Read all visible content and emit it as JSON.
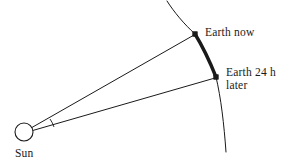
{
  "figure": {
    "background_color": "#ffffff",
    "stroke_color": "#1a1a1a",
    "labels": {
      "earth_now": "Earth now",
      "earth_later_line1": "Earth 24 h",
      "earth_later_line2": "later",
      "sun": "Sun"
    },
    "elements": {
      "sun_icon": "sun-circle",
      "orbit_arc": "orbit-arc",
      "traveled_arc": "traveled-arc-segment",
      "radius_line_now": "radius-line-earth-now",
      "radius_line_later": "radius-line-earth-later",
      "angle_marker": "swept-angle-arc",
      "marker_now": "earth-now-marker",
      "marker_later": "earth-later-marker"
    },
    "geometry": {
      "sun_center": [
        24,
        132
      ],
      "sun_radius": 9,
      "earth_now_point": [
        195,
        34
      ],
      "earth_later_point": [
        216,
        77
      ],
      "arc_top_point": [
        167,
        1
      ],
      "arc_bottom_point": [
        226,
        152
      ],
      "arc_radius": 200,
      "angle_marker_radius": 30,
      "marker_size": 4,
      "thin_stroke_width": 1,
      "thick_stroke_width": 3.2
    }
  }
}
